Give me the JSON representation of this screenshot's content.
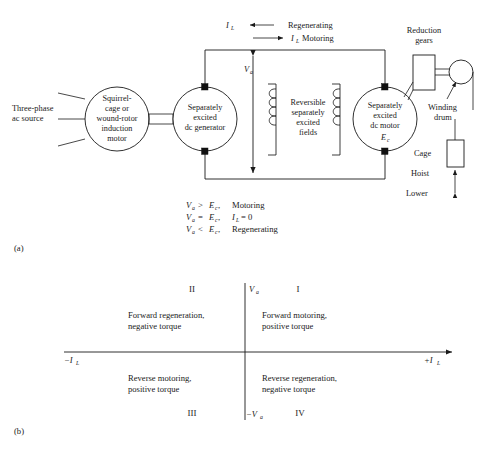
{
  "figure": {
    "part_a_label": "(a)",
    "part_b_label": "(b)"
  },
  "schematic": {
    "source_label_line1": "Three-phase",
    "source_label_line2": "ac source",
    "induction_motor": {
      "line1": "Squirrel-",
      "line2": "cage or",
      "line3": "wound-rotor",
      "line4": "induction",
      "line5": "motor"
    },
    "dc_generator": {
      "line1": "Separately",
      "line2": "excited",
      "line3": "dc generator"
    },
    "fields": {
      "line1": "Reversible",
      "line2": "separately",
      "line3": "excited",
      "line4": "fields"
    },
    "dc_motor": {
      "line1": "Separately",
      "line2": "excited",
      "line3": "dc motor",
      "emf_symbol": "E",
      "emf_subscript": "c"
    },
    "armature_voltage": {
      "symbol": "V",
      "subscript": "a"
    },
    "current_symbol": "I",
    "current_subscript": "L",
    "regenerating_label": "Regenerating",
    "motoring_label": "Motoring",
    "reduction_gears_line1": "Reduction",
    "reduction_gears_line2": "gears",
    "winding_drum_line1": "Winding",
    "winding_drum_line2": "drum",
    "cage_label": "Cage",
    "hoist_label": "Hoist",
    "lower_label": "Lower"
  },
  "equations": [
    {
      "left": "V",
      "left_sub": "a",
      "relation": ">",
      "right": "E",
      "right_sub": "c",
      "comma": ",",
      "result": "Motoring"
    },
    {
      "left": "V",
      "left_sub": "a",
      "relation": "=",
      "right": "E",
      "right_sub": "c",
      "comma": ",",
      "result_sym": "I",
      "result_sub": "L",
      "result_rel": "= 0"
    },
    {
      "left": "V",
      "left_sub": "a",
      "relation": "<",
      "right": "E",
      "right_sub": "c",
      "comma": ",",
      "result": "Regenerating"
    }
  ],
  "quadrant_chart": {
    "y_axis_positive": {
      "symbol": "V",
      "subscript": "a"
    },
    "y_axis_negative": {
      "symbol": "−V",
      "subscript": "a"
    },
    "x_axis_positive": {
      "symbol": "+I",
      "subscript": "L"
    },
    "x_axis_negative": {
      "symbol": "−I",
      "subscript": "L"
    },
    "quadrants": [
      {
        "numeral": "I",
        "line1": "Forward motoring,",
        "line2": "positive torque"
      },
      {
        "numeral": "II",
        "line1": "Forward regeneration,",
        "line2": "negative torque"
      },
      {
        "numeral": "III",
        "line1": "Reverse motoring,",
        "line2": "positive torque"
      },
      {
        "numeral": "IV",
        "line1": "Reverse regeneration,",
        "line2": "negative torque"
      }
    ]
  },
  "colors": {
    "ink": "#1a1a1a",
    "background": "#ffffff"
  }
}
